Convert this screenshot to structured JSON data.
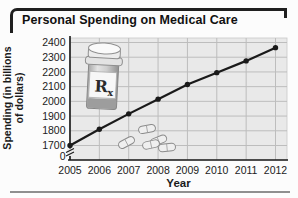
{
  "title": "Personal Spending on Medical Care",
  "chart_data": {
    "type": "line",
    "x": [
      2005,
      2006,
      2007,
      2008,
      2009,
      2010,
      2011,
      2012
    ],
    "values": [
      1700,
      1810,
      1915,
      2015,
      2115,
      2195,
      2275,
      2365
    ],
    "title": "Personal Spending on Medical Care",
    "xlabel": "Year",
    "ylabel_line1": "Spending (in billions",
    "ylabel_line2": "of dollars)",
    "yticks": [
      0,
      1700,
      1800,
      1900,
      2000,
      2100,
      2200,
      2300,
      2400
    ],
    "ylim": [
      1700,
      2400
    ],
    "y_axis_break": true,
    "grid": true,
    "legend_position": "none",
    "line_color": "#1a1a1a",
    "marker": "circle"
  },
  "decorations": {
    "rx_main": "R",
    "rx_sub": "x",
    "pill_count": 5
  },
  "colors": {
    "plot_background": "#e9e9e9",
    "grid": "#bdbdbd",
    "axis": "#1a1a1a",
    "divider": "#8f8f8f",
    "line": "#1a1a1a"
  }
}
